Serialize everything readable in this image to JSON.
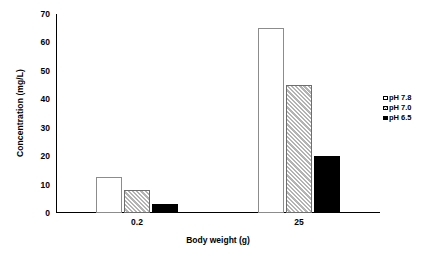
{
  "chart_data": {
    "type": "bar",
    "title": "",
    "xlabel": "Body weight (g)",
    "ylabel": "Concentration (mg/L)",
    "categories": [
      "0.2",
      "25"
    ],
    "series": [
      {
        "name": "pH 7.8",
        "values": [
          12.5,
          65
        ],
        "style": "open"
      },
      {
        "name": "pH 7.0",
        "values": [
          8,
          45
        ],
        "style": "hatch"
      },
      {
        "name": "pH 6.5",
        "values": [
          3,
          20
        ],
        "style": "solid"
      }
    ],
    "ylim": [
      0,
      70
    ],
    "yticks": [
      0,
      10,
      20,
      30,
      40,
      50,
      60,
      70
    ],
    "ytick_labels": [
      "0",
      "10",
      "20",
      "30",
      "40",
      "50",
      "60",
      "70"
    ],
    "grid": false,
    "legend_position": "right",
    "legend_entries": [
      "pH 7.8",
      "pH 7.0",
      "pH 6.5"
    ],
    "axis_color": "#000000",
    "background": "#ffffff"
  }
}
